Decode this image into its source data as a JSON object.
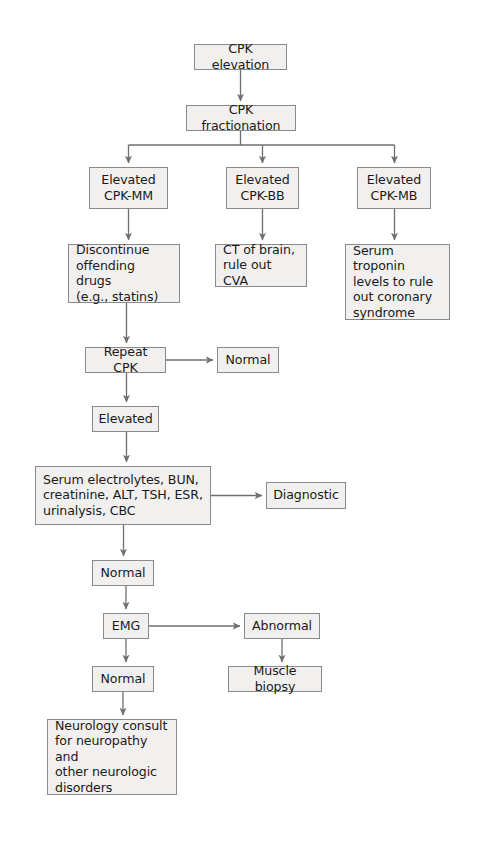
{
  "figure": {
    "type": "flowchart",
    "colors": {
      "node_fill": "#f1f0ee",
      "node_border": "#8a8a8a",
      "edge": "#6f6f6f",
      "text": "#1a1a1a",
      "background": "#ffffff"
    }
  },
  "nodes": {
    "cpk_elevation": {
      "label": "CPK elevation",
      "x": 194,
      "y": 44,
      "w": 93,
      "h": 26,
      "align": "center"
    },
    "cpk_fractionation": {
      "label": "CPK fractionation",
      "x": 186,
      "y": 105,
      "w": 110,
      "h": 26,
      "align": "center"
    },
    "elevated_mm": {
      "label": "Elevated\nCPK-MM",
      "x": 89,
      "y": 167,
      "w": 79,
      "h": 42,
      "align": "center"
    },
    "elevated_bb": {
      "label": "Elevated\nCPK-BB",
      "x": 226,
      "y": 167,
      "w": 73,
      "h": 42,
      "align": "center"
    },
    "elevated_mb": {
      "label": "Elevated\nCPK-MB",
      "x": 357,
      "y": 167,
      "w": 74,
      "h": 42,
      "align": "center"
    },
    "discontinue_drugs": {
      "label": "Discontinue\noffending drugs\n(e.g., statins)",
      "x": 68,
      "y": 244,
      "w": 112,
      "h": 59,
      "align": "left"
    },
    "ct_brain": {
      "label": "CT of brain,\nrule out CVA",
      "x": 215,
      "y": 244,
      "w": 92,
      "h": 43,
      "align": "left"
    },
    "serum_troponin": {
      "label": "Serum troponin\nlevels to rule\nout coronary\nsyndrome",
      "x": 345,
      "y": 244,
      "w": 105,
      "h": 76,
      "align": "left"
    },
    "repeat_cpk": {
      "label": "Repeat CPK",
      "x": 85,
      "y": 347,
      "w": 81,
      "h": 26,
      "align": "center"
    },
    "normal_after_repeat": {
      "label": "Normal",
      "x": 217,
      "y": 347,
      "w": 62,
      "h": 26,
      "align": "center"
    },
    "elevated_after_repeat": {
      "label": "Elevated",
      "x": 92,
      "y": 406,
      "w": 67,
      "h": 26,
      "align": "center"
    },
    "lab_panel": {
      "label": "Serum electrolytes, BUN,\ncreatinine, ALT, TSH, ESR,\nurinalysis, CBC",
      "x": 35,
      "y": 466,
      "w": 176,
      "h": 59,
      "align": "left"
    },
    "diagnostic": {
      "label": "Diagnostic",
      "x": 266,
      "y": 482,
      "w": 80,
      "h": 27,
      "align": "center"
    },
    "normal_after_labs": {
      "label": "Normal",
      "x": 92,
      "y": 560,
      "w": 62,
      "h": 26,
      "align": "center"
    },
    "emg": {
      "label": "EMG",
      "x": 103,
      "y": 613,
      "w": 46,
      "h": 26,
      "align": "center"
    },
    "abnormal": {
      "label": "Abnormal",
      "x": 244,
      "y": 613,
      "w": 76,
      "h": 26,
      "align": "center"
    },
    "normal_after_emg": {
      "label": "Normal",
      "x": 92,
      "y": 666,
      "w": 62,
      "h": 26,
      "align": "center"
    },
    "muscle_biopsy": {
      "label": "Muscle biopsy",
      "x": 228,
      "y": 666,
      "w": 94,
      "h": 26,
      "align": "center"
    },
    "neurology_consult": {
      "label": "Neurology consult\nfor neuropathy and\nother neurologic\ndisorders",
      "x": 47,
      "y": 719,
      "w": 130,
      "h": 76,
      "align": "left"
    }
  },
  "edges": [
    {
      "from": "cpk_elevation",
      "to": "cpk_fractionation",
      "kind": "vertical-arrow"
    },
    {
      "from": "cpk_fractionation",
      "to": "elevated_mm",
      "kind": "branch-arrow"
    },
    {
      "from": "cpk_fractionation",
      "to": "elevated_bb",
      "kind": "branch-arrow"
    },
    {
      "from": "cpk_fractionation",
      "to": "elevated_mb",
      "kind": "branch-arrow"
    },
    {
      "from": "elevated_mm",
      "to": "discontinue_drugs",
      "kind": "vertical-arrow"
    },
    {
      "from": "elevated_bb",
      "to": "ct_brain",
      "kind": "vertical-arrow"
    },
    {
      "from": "elevated_mb",
      "to": "serum_troponin",
      "kind": "vertical-arrow"
    },
    {
      "from": "discontinue_drugs",
      "to": "repeat_cpk",
      "kind": "vertical-arrow"
    },
    {
      "from": "repeat_cpk",
      "to": "normal_after_repeat",
      "kind": "horizontal-arrow"
    },
    {
      "from": "repeat_cpk",
      "to": "elevated_after_repeat",
      "kind": "vertical-arrow"
    },
    {
      "from": "elevated_after_repeat",
      "to": "lab_panel",
      "kind": "vertical-arrow"
    },
    {
      "from": "lab_panel",
      "to": "diagnostic",
      "kind": "horizontal-arrow"
    },
    {
      "from": "lab_panel",
      "to": "normal_after_labs",
      "kind": "vertical-arrow"
    },
    {
      "from": "normal_after_labs",
      "to": "emg",
      "kind": "vertical-arrow"
    },
    {
      "from": "emg",
      "to": "abnormal",
      "kind": "horizontal-arrow"
    },
    {
      "from": "emg",
      "to": "normal_after_emg",
      "kind": "vertical-arrow"
    },
    {
      "from": "abnormal",
      "to": "muscle_biopsy",
      "kind": "vertical-arrow"
    },
    {
      "from": "normal_after_emg",
      "to": "neurology_consult",
      "kind": "vertical-arrow"
    }
  ]
}
